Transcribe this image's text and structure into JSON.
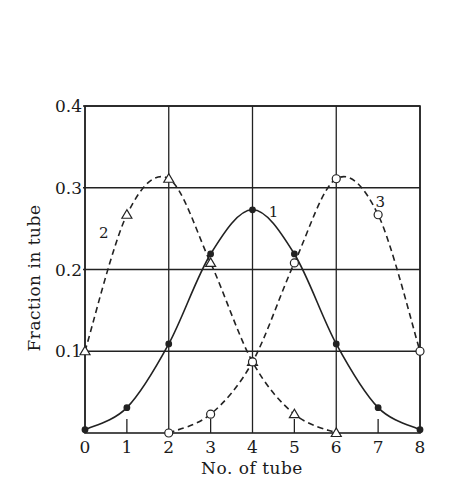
{
  "chart_data": {
    "type": "line",
    "title": "",
    "xlabel": "No. of tube",
    "ylabel": "Fraction in tube",
    "xlim": [
      0,
      8
    ],
    "ylim": [
      0,
      0.4
    ],
    "x_ticks": [
      "0",
      "1",
      "2",
      "3",
      "4",
      "5",
      "6",
      "7",
      "8"
    ],
    "y_ticks": [
      "0.1",
      "0.2",
      "0.3",
      "0.4"
    ],
    "y_tick_values": [
      0.1,
      0.2,
      0.3,
      0.4
    ],
    "grid": {
      "vertical_at": [
        0,
        2,
        4,
        6,
        8
      ],
      "horizontal_at": [
        0.1,
        0.2,
        0.3,
        0.4
      ],
      "minor_ticks_at": [
        1,
        3,
        5,
        7
      ]
    },
    "legend": "none (curves labelled inline 1, 2, 3)",
    "series": [
      {
        "name": "1",
        "style": "solid",
        "marker": "filled-circle",
        "x": [
          0,
          1,
          2,
          3,
          4,
          5,
          6,
          7,
          8
        ],
        "values": [
          0.004,
          0.031,
          0.109,
          0.219,
          0.273,
          0.219,
          0.109,
          0.031,
          0.004
        ],
        "label_pos": [
          4.5,
          0.27
        ]
      },
      {
        "name": "2",
        "style": "dashed",
        "marker": "open-triangle",
        "x": [
          0,
          1,
          2,
          3,
          4,
          5,
          6
        ],
        "values": [
          0.1,
          0.267,
          0.311,
          0.208,
          0.087,
          0.023,
          0.0
        ],
        "label_pos": [
          0.45,
          0.245
        ]
      },
      {
        "name": "3",
        "style": "dashed",
        "marker": "open-circle",
        "x": [
          2,
          3,
          4,
          5,
          6,
          7,
          8
        ],
        "values": [
          0.0,
          0.023,
          0.087,
          0.208,
          0.311,
          0.267,
          0.1
        ],
        "label_pos": [
          7.05,
          0.282
        ]
      }
    ]
  }
}
